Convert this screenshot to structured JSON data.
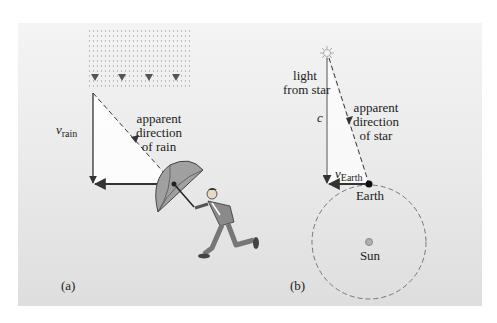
{
  "panel_a": {
    "label": "(a)",
    "velocity_symbol": "v",
    "velocity_subscript": "rain",
    "apparent_direction_text": [
      "apparent",
      "direction",
      "of rain"
    ],
    "figure": "running man holding umbrella tilted forward"
  },
  "panel_b": {
    "label": "(b)",
    "light_text": [
      "light",
      "from star"
    ],
    "c_symbol": "c",
    "velocity_symbol": "v",
    "velocity_subscript": "Earth",
    "apparent_direction_text": [
      "apparent",
      "direction",
      "of star"
    ],
    "earth_label": "Earth",
    "sun_label": "Sun",
    "star_icon": "star-icon"
  },
  "colors": {
    "background": "#ebebeb",
    "lines": "#333333",
    "umbrella": "#9a9a9a",
    "sun": "#a8a8a8",
    "orbit": "#777777"
  }
}
